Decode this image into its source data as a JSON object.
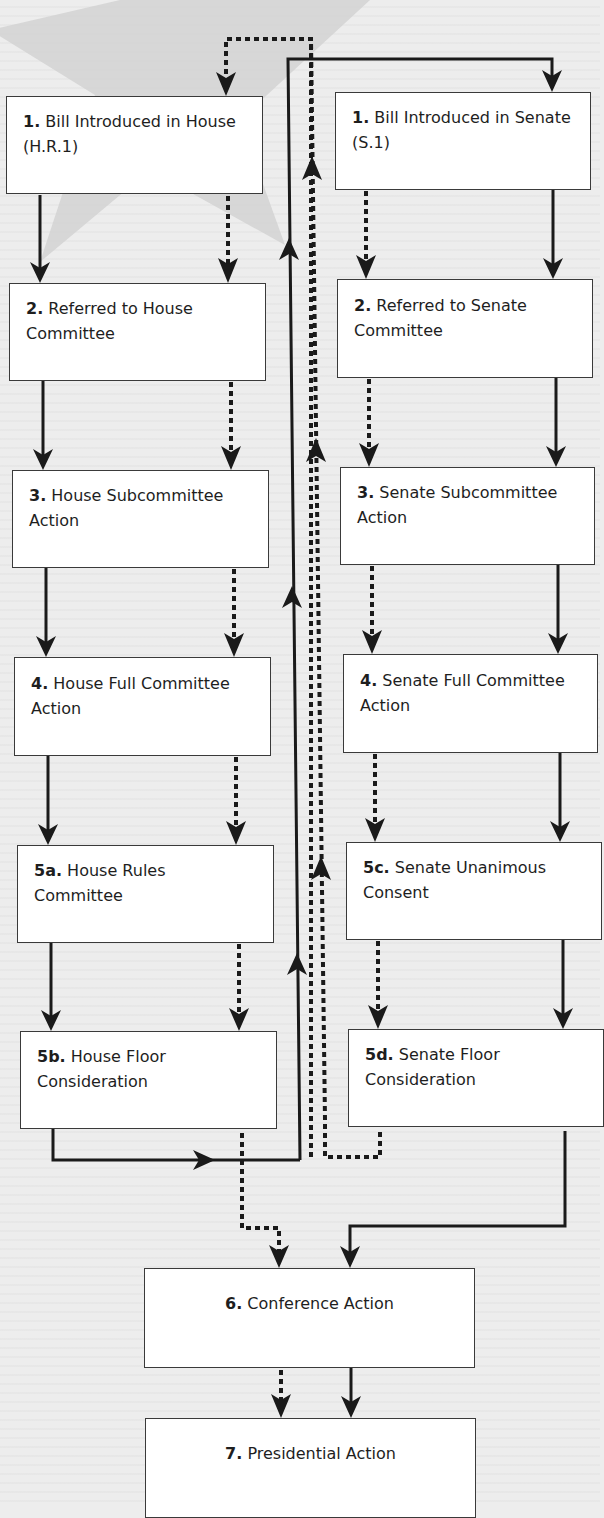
{
  "colors": {
    "background": "#ededed",
    "star": "#d4d4d4",
    "box_fill": "#ffffff",
    "box_border": "#3a3a3a",
    "line": "#1a1a1a",
    "text": "#1e1e1e"
  },
  "legend_semantics": {
    "solid_line": "path of House-originated bill (H.R.1)",
    "dashed_line": "path of Senate-originated bill (S.1)"
  },
  "house": {
    "steps": [
      {
        "num": "1.",
        "label": "Bill Introduced in House (H.R.1)"
      },
      {
        "num": "2.",
        "label": "Referred to House Committee"
      },
      {
        "num": "3.",
        "label": "House Subcommittee Action"
      },
      {
        "num": "4.",
        "label": "House Full Committee Action"
      },
      {
        "num": "5a.",
        "label": "House Rules Committee"
      },
      {
        "num": "5b.",
        "label": "House Floor Consideration"
      }
    ]
  },
  "senate": {
    "steps": [
      {
        "num": "1.",
        "label": "Bill Introduced in Senate (S.1)"
      },
      {
        "num": "2.",
        "label": "Referred to Senate Committee"
      },
      {
        "num": "3.",
        "label": "Senate Subcommittee Action"
      },
      {
        "num": "4.",
        "label": "Senate Full Committee Action"
      },
      {
        "num": "5c.",
        "label": "Senate Unanimous Consent"
      },
      {
        "num": "5d.",
        "label": "Senate Floor Consideration"
      }
    ]
  },
  "joint": {
    "steps": [
      {
        "num": "6.",
        "label": "Conference Action"
      },
      {
        "num": "7.",
        "label": "Presidential Action"
      }
    ]
  }
}
